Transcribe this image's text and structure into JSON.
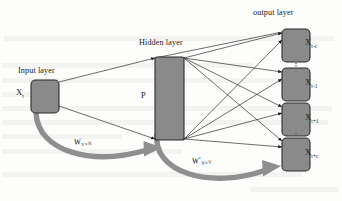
{
  "figure": {
    "type": "neural-network-architecture-diagram",
    "title_visible": false,
    "background_color": "#fdfdfc",
    "node_fill_color": "#8a8a8a",
    "node_stroke_color": "#2b2b2b",
    "connection_color": "#1f1f1f",
    "weight_arrow_color": "#8f8f8f"
  },
  "labels": {
    "input_layer": "Input layer",
    "hidden_layer": "Hidden layer",
    "output_layer": "output layer",
    "hidden_node": "P"
  },
  "input_node": {
    "name": "X",
    "subscript": "t"
  },
  "output_nodes": [
    {
      "name": "X",
      "subscript": "t-c"
    },
    {
      "name": "X",
      "subscript": "t-1"
    },
    {
      "name": "X",
      "subscript": "t+1"
    },
    {
      "name": "X",
      "subscript": "t+c"
    }
  ],
  "weights": [
    {
      "id": "input-to-hidden",
      "name": "W",
      "subscript": "V×N"
    },
    {
      "id": "hidden-to-output",
      "name": "W'",
      "subscript": "N×V"
    }
  ],
  "ellipsis": {
    "glyph": "⋮",
    "positions": [
      "between-output-1-and-2",
      "between-output-3-and-4"
    ]
  }
}
